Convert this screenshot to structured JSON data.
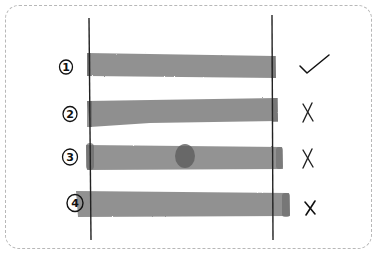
{
  "diagram": {
    "colors": {
      "bar": "#8a8a8a",
      "bar_dark": "#6a6a6a",
      "line": "#222222",
      "frame": "#b8b8b8",
      "mark": "#111111"
    },
    "boundaries": {
      "left_x": 89,
      "right_x": 272
    },
    "rows": [
      {
        "label": "1",
        "mark": "✓",
        "mark_name": "check-icon",
        "result": "fits"
      },
      {
        "label": "2",
        "mark": "X",
        "mark_name": "cross-icon",
        "result": "does-not-fit"
      },
      {
        "label": "3",
        "mark": "X",
        "mark_name": "cross-icon",
        "result": "does-not-fit"
      },
      {
        "label": "4",
        "mark": "x",
        "mark_name": "cross-icon",
        "result": "does-not-fit"
      }
    ]
  }
}
